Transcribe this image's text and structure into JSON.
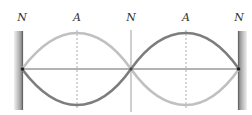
{
  "diagram": {
    "type": "standing-wave",
    "labels": [
      {
        "text": "N",
        "x": 22
      },
      {
        "text": "A",
        "x": 77
      },
      {
        "text": "N",
        "x": 131
      },
      {
        "text": "A",
        "x": 186
      },
      {
        "text": "N",
        "x": 239
      }
    ],
    "colors": {
      "wave_light": "#bdbdbd",
      "wave_dark": "#808080",
      "wall": "#8a8a8a",
      "axis": "#555555"
    }
  }
}
